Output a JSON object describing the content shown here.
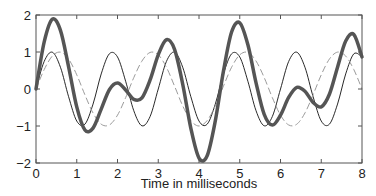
{
  "chart_data": {
    "type": "line",
    "title": "",
    "xlabel": "Time in milliseconds",
    "ylabel": "",
    "xlim": [
      0,
      8
    ],
    "ylim": [
      -2,
      2
    ],
    "xticks": [
      "0",
      "1",
      "2",
      "3",
      "4",
      "5",
      "6",
      "7",
      "8"
    ],
    "yticks": [
      "2",
      "1",
      "0",
      "−1",
      "−2"
    ],
    "grid": false,
    "legend": null,
    "x": [
      0,
      0.2,
      0.4,
      0.6,
      0.8,
      1.0,
      1.2,
      1.4,
      1.6,
      1.8,
      2.0,
      2.2,
      2.4,
      2.6,
      2.8,
      3.0,
      3.2,
      3.4,
      3.6,
      3.8,
      4.0,
      4.2,
      4.4,
      4.6,
      4.8,
      5.0,
      5.2,
      5.4,
      5.6,
      5.8,
      6.0,
      6.2,
      6.4,
      6.6,
      6.8,
      7.0,
      7.2,
      7.4,
      7.6,
      7.8,
      8.0
    ],
    "series": [
      {
        "name": "component 1 (thin solid)",
        "style": "solid-thin",
        "color": "#111111",
        "values": [
          0,
          0.743,
          0.995,
          0.588,
          -0.208,
          -0.866,
          -0.951,
          -0.407,
          0.407,
          0.951,
          0.866,
          0.208,
          -0.588,
          -0.995,
          -0.743,
          0,
          0.743,
          0.995,
          0.588,
          -0.208,
          -0.866,
          -0.951,
          -0.407,
          0.407,
          0.951,
          0.866,
          0.208,
          -0.588,
          -0.995,
          -0.743,
          0,
          0.743,
          0.995,
          0.588,
          -0.208,
          -0.866,
          -0.951,
          -0.407,
          0.407,
          0.951,
          0.866
        ]
      },
      {
        "name": "component 2 (dashed)",
        "style": "dashed",
        "color": "#9a9a9a",
        "values": [
          0,
          0.523,
          0.891,
          0.997,
          0.809,
          0.383,
          -0.156,
          -0.649,
          -0.951,
          -0.972,
          -0.707,
          -0.233,
          0.309,
          0.756,
          0.988,
          0.924,
          0.588,
          0.078,
          -0.454,
          -0.853,
          -1.0,
          -0.853,
          -0.454,
          0.078,
          0.588,
          0.924,
          0.988,
          0.756,
          0.309,
          -0.233,
          -0.707,
          -0.972,
          -0.951,
          -0.649,
          -0.156,
          0.383,
          0.809,
          0.997,
          0.891,
          0.523,
          0
        ]
      },
      {
        "name": "sum (thick solid)",
        "style": "solid-thick",
        "color": "#555555",
        "values": [
          0,
          1.266,
          1.886,
          1.585,
          0.601,
          -0.483,
          -1.107,
          -1.056,
          -0.544,
          -0.021,
          0.159,
          -0.025,
          -0.279,
          -0.239,
          0.245,
          0.924,
          1.331,
          1.073,
          0.134,
          -1.061,
          -1.866,
          -1.804,
          -0.861,
          0.485,
          1.539,
          1.79,
          1.196,
          0.168,
          -0.686,
          -0.976,
          -0.707,
          -0.229,
          0.044,
          -0.061,
          -0.364,
          -0.483,
          -0.142,
          0.59,
          1.298,
          1.474,
          0.866
        ]
      }
    ]
  }
}
